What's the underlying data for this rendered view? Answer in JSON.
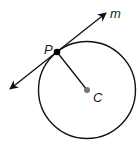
{
  "diagram": {
    "labels": {
      "line": "m",
      "point_tangent": "P",
      "center": "C"
    },
    "colors": {
      "stroke": "#111111",
      "point_p": "#000000",
      "center_point": "#777777"
    }
  }
}
